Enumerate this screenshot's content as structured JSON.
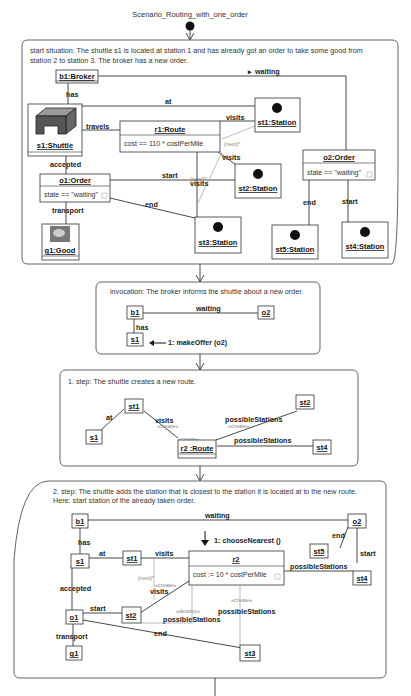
{
  "title": "Scenario_Routing_with_one_order",
  "frames": [
    {
      "description": [
        "start situation: The shuttle s1 is located at station 1 and has already got an order to take some good from",
        "station 2 to station 3. The broker has a new order."
      ],
      "objects": {
        "b1": "b1:Broker",
        "s1": "s1:Shuttle",
        "r1": "r1:Route",
        "r1_attr": "cost == 110 * costPerMile",
        "st1": "st1:Station",
        "st2": "st2:Station",
        "st3": "st3:Station",
        "st4": "st4:Station",
        "st5": "st5:Station",
        "o1": "o1:Order",
        "o1_attr": "state == \"waiting\"",
        "o2": "o2:Order",
        "o2_attr": "state == \"waiting\"",
        "g1": "g1:Good"
      },
      "links": {
        "waiting": "waiting",
        "has": "has",
        "at": "at",
        "travels": "travels",
        "visits1": "visits",
        "visits2": "visits",
        "visits3": "visits",
        "accepted": "accepted",
        "start": "start",
        "end": "end",
        "transport": "transport",
        "o2_end": "end",
        "o2_start": "start",
        "next1": "{next}*",
        "next2": "{next}*"
      }
    },
    {
      "description": [
        "invocation: The broker informs the shuttle about a new order."
      ],
      "objects": {
        "b1": "b1",
        "o2": "o2",
        "s1": "s1"
      },
      "links": {
        "waiting": "waiting",
        "has": "has"
      },
      "message": "1: makeOffer (o2)"
    },
    {
      "description": [
        "1. step: The shuttle creates a new route."
      ],
      "objects": {
        "st1": "st1",
        "s1": "s1",
        "r2": "r2 :Route",
        "st2": "st2",
        "st4": "st4"
      },
      "links": {
        "at": "at",
        "visits": "visits",
        "create1": "«create»",
        "create2": "«create»",
        "create3": "«create»",
        "possible1": "possibleStations",
        "possible2": "possibleStations"
      }
    },
    {
      "description": [
        "2. step: The shuttle adds the station that is closest to the station it is located at to the new route.",
        "Here: start station of the already taken order."
      ],
      "objects": {
        "b1": "b1",
        "o2": "o2",
        "s1": "s1",
        "st1": "st1",
        "r2": "r2",
        "r2_attr": "cost := 10 * costPerMile",
        "st5": "st5",
        "st4": "st4",
        "o1": "o1",
        "st2": "st2",
        "g1": "g1",
        "st3": "st3"
      },
      "links": {
        "waiting": "waiting",
        "has": "has",
        "at": "at",
        "visits1": "visits",
        "visits2": "visits",
        "next": "{next}*",
        "create1": "«create»",
        "create2": "«create»",
        "destroy": "«destroy»",
        "accepted": "accepted",
        "start": "start",
        "end": "end",
        "transport": "transport",
        "o2_end": "end",
        "o2_start": "start",
        "possible1": "possibleStations",
        "possible2": "possibleStations",
        "possible3": "possibleStations"
      },
      "message": "1: chooseNearest ()"
    }
  ]
}
